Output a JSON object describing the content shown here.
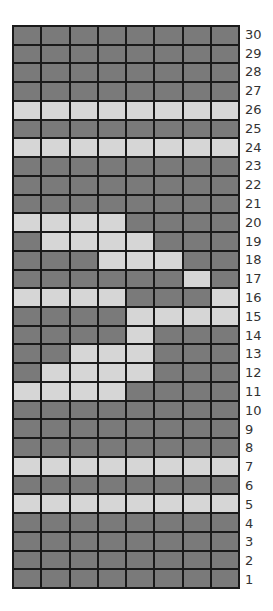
{
  "chart_data": {
    "type": "heatmap",
    "title": "",
    "columns": 8,
    "rows": 30,
    "row_label_side": "right",
    "row_labels_top_to_bottom": [
      30,
      29,
      28,
      27,
      26,
      25,
      24,
      23,
      22,
      21,
      20,
      19,
      18,
      17,
      16,
      15,
      14,
      13,
      12,
      11,
      10,
      9,
      8,
      7,
      6,
      5,
      4,
      3,
      2,
      1
    ],
    "colors": {
      "dark": "#7a7a7a",
      "light": "#d6d6d6",
      "grid_line": "#1a1a1a"
    },
    "legend": "1 = light cell, 0 = dark cell; columns numbered 1-8 left to right",
    "grid": {
      "30": [
        0,
        0,
        0,
        0,
        0,
        0,
        0,
        0
      ],
      "29": [
        0,
        0,
        0,
        0,
        0,
        0,
        0,
        0
      ],
      "28": [
        0,
        0,
        0,
        0,
        0,
        0,
        0,
        0
      ],
      "27": [
        0,
        0,
        0,
        0,
        0,
        0,
        0,
        0
      ],
      "26": [
        1,
        1,
        1,
        1,
        1,
        1,
        1,
        1
      ],
      "25": [
        0,
        0,
        0,
        0,
        0,
        0,
        0,
        0
      ],
      "24": [
        1,
        1,
        1,
        1,
        1,
        1,
        1,
        1
      ],
      "23": [
        0,
        0,
        0,
        0,
        0,
        0,
        0,
        0
      ],
      "22": [
        0,
        0,
        0,
        0,
        0,
        0,
        0,
        0
      ],
      "21": [
        0,
        0,
        0,
        0,
        0,
        0,
        0,
        0
      ],
      "20": [
        1,
        1,
        1,
        1,
        0,
        0,
        0,
        0
      ],
      "19": [
        0,
        1,
        1,
        1,
        1,
        0,
        0,
        0
      ],
      "18": [
        0,
        0,
        0,
        1,
        1,
        1,
        0,
        0
      ],
      "17": [
        0,
        0,
        0,
        0,
        0,
        0,
        1,
        0
      ],
      "16": [
        1,
        1,
        1,
        1,
        0,
        0,
        0,
        1
      ],
      "15": [
        0,
        0,
        0,
        0,
        1,
        1,
        1,
        1
      ],
      "14": [
        0,
        0,
        0,
        0,
        1,
        0,
        0,
        0
      ],
      "13": [
        0,
        0,
        1,
        1,
        1,
        0,
        0,
        0
      ],
      "12": [
        0,
        1,
        1,
        1,
        1,
        0,
        0,
        0
      ],
      "11": [
        1,
        1,
        1,
        1,
        0,
        0,
        0,
        0
      ],
      "10": [
        0,
        0,
        0,
        0,
        0,
        0,
        0,
        0
      ],
      "9": [
        0,
        0,
        0,
        0,
        0,
        0,
        0,
        0
      ],
      "8": [
        0,
        0,
        0,
        0,
        0,
        0,
        0,
        0
      ],
      "7": [
        1,
        1,
        1,
        1,
        1,
        1,
        1,
        1
      ],
      "6": [
        0,
        0,
        0,
        0,
        0,
        0,
        0,
        0
      ],
      "5": [
        1,
        1,
        1,
        1,
        1,
        1,
        1,
        1
      ],
      "4": [
        0,
        0,
        0,
        0,
        0,
        0,
        0,
        0
      ],
      "3": [
        0,
        0,
        0,
        0,
        0,
        0,
        0,
        0
      ],
      "2": [
        0,
        0,
        0,
        0,
        0,
        0,
        0,
        0
      ],
      "1": [
        0,
        0,
        0,
        0,
        0,
        0,
        0,
        0
      ]
    }
  }
}
